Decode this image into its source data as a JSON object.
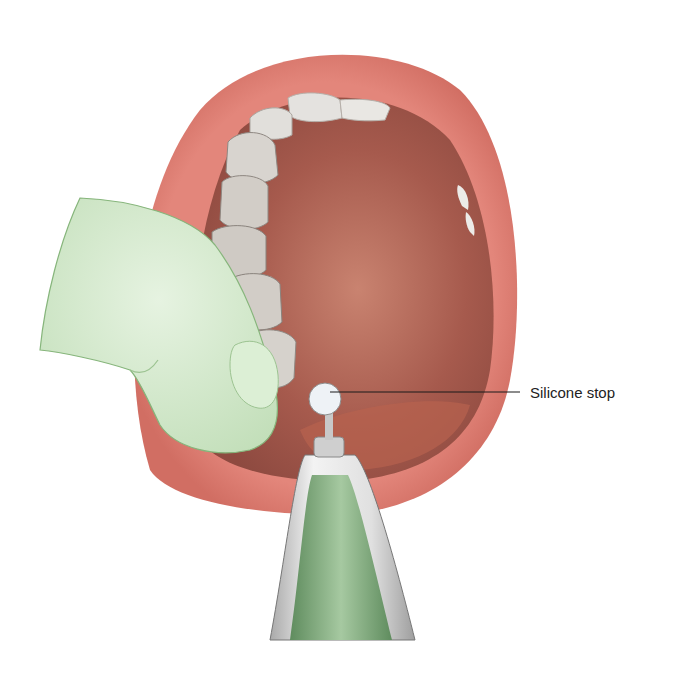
{
  "figure": {
    "labels": [
      {
        "text": "Silicone stop",
        "x": 530,
        "y": 384
      }
    ],
    "colors": {
      "lip": "#e08278",
      "lip_inner": "#c9594f",
      "oral_cavity": "#a4584c",
      "oral_cavity_light": "#c47a66",
      "teeth": "#e4e2df",
      "teeth_shadow": "#9a948e",
      "glove": "#cfe6c8",
      "glove_outline": "#7fae74",
      "instrument_metal": "#d9d9d9",
      "instrument_green": "#6f9b6e",
      "silicone_stop": "#eef2f6",
      "leader_line": "#1a1a1a"
    }
  }
}
